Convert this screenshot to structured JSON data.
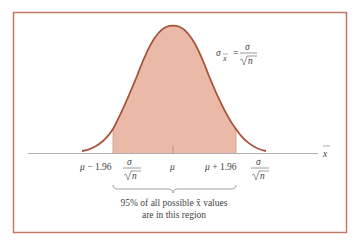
{
  "diagram": {
    "type": "normal-distribution-sampling",
    "formula": {
      "lhs_symbol": "σ",
      "lhs_subscript": "x̄",
      "equals": "=",
      "numerator": "σ",
      "denominator_root": "√",
      "denominator_var": "n"
    },
    "axis_label": "x̄",
    "center_label": "μ",
    "left_bound": {
      "prefix": "μ − 1.96",
      "numerator": "σ",
      "denominator": "√n"
    },
    "right_bound": {
      "prefix": "μ + 1.96",
      "numerator": "σ",
      "denominator": "√n"
    },
    "annotation": {
      "line1": "95% of all possible x̄ values",
      "line2": "are in this region"
    },
    "colors": {
      "frame": "#c27a66",
      "curve": "#a6523a",
      "shaded_region": "#ebb9a8",
      "axis": "#9a9a9a",
      "text": "#444444"
    },
    "shaded_percentage": 95,
    "z_value": 1.96
  }
}
